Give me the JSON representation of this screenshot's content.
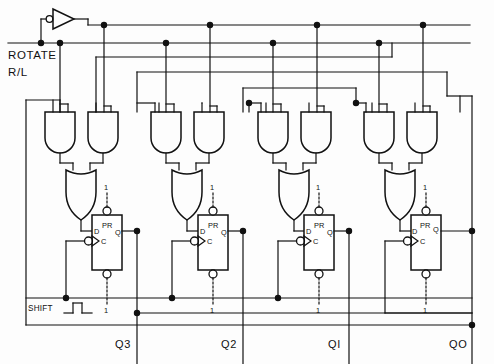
{
  "diagram": {
    "line_color": "#111111",
    "background_color": "#fdfdfd"
  },
  "inputs": {
    "rotate": {
      "label_line1": "ROTATE",
      "label_line2": "R/L",
      "name": "rotate-r-l-input"
    },
    "shift": {
      "label": "SHIFT",
      "name": "shift-clock-input"
    }
  },
  "logic_high": {
    "label": "1"
  },
  "flipflops": [
    {
      "id": "ff3",
      "d": "D",
      "pr": "PR",
      "q": "Q",
      "c": "C",
      "preset_label": "1",
      "clear_label": "1",
      "output_label": "Q3"
    },
    {
      "id": "ff2",
      "d": "D",
      "pr": "PR",
      "q": "Q",
      "c": "C",
      "preset_label": "1",
      "clear_label": "1",
      "output_label": "Q2"
    },
    {
      "id": "ff1",
      "d": "D",
      "pr": "PR",
      "q": "Q",
      "c": "C",
      "preset_label": "1",
      "clear_label": "1",
      "output_label": "QI"
    },
    {
      "id": "ff0",
      "d": "D",
      "pr": "PR",
      "q": "Q",
      "c": "C",
      "preset_label": "1",
      "clear_label": "1",
      "output_label": "QO"
    }
  ],
  "gates": {
    "inverter": {
      "name": "rotate-inverter",
      "label": ""
    },
    "and_gate_count": 8,
    "or_gate_count": 4
  },
  "output_labels": {
    "q3": "Q3",
    "q2": "Q2",
    "q1": "QI",
    "q0": "QO"
  }
}
